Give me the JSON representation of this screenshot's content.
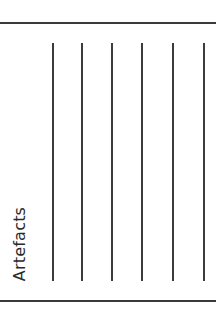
{
  "worksheet": {
    "section_label": "Artefacts",
    "writing_lines": {
      "count": 6,
      "x_positions": [
        53,
        82,
        112,
        142,
        173,
        204
      ]
    },
    "colors": {
      "line": "#3c3c3c",
      "text": "#2a2a2a",
      "background": "#ffffff"
    }
  }
}
